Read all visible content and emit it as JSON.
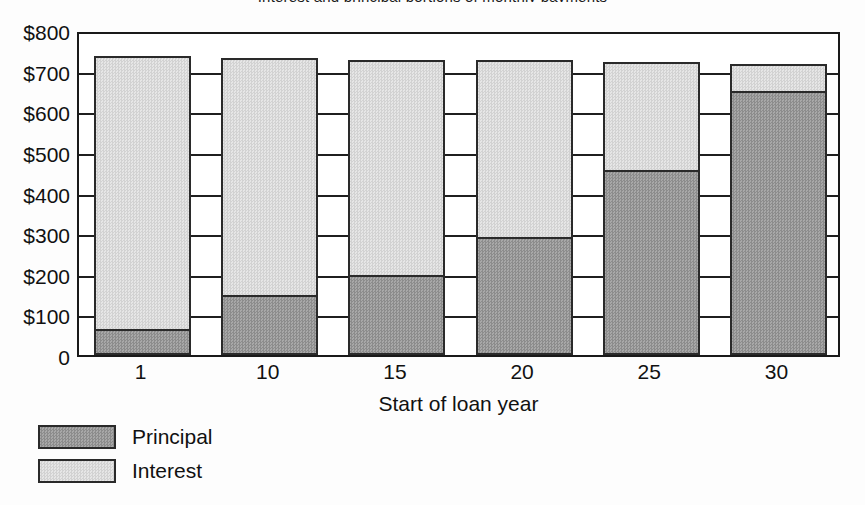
{
  "figure": {
    "title_cropped": "Interest and principal portions of monthly payments",
    "background": "#fdfdfd",
    "frame_color": "#1a1a1a"
  },
  "colors": {
    "principal": "#999999",
    "interest": "#dcdcdc",
    "ink": "#1a1a1a"
  },
  "legend": {
    "position": "bottom-left",
    "items": [
      {
        "label": "Principal",
        "swatch": "principal"
      },
      {
        "label": "Interest",
        "swatch": "interest"
      }
    ]
  },
  "axes": {
    "y": {
      "ticks": [
        "$800",
        "$700",
        "$600",
        "$500",
        "$400",
        "$300",
        "$200",
        "$100",
        "0"
      ],
      "values": [
        800,
        700,
        600,
        500,
        400,
        300,
        200,
        100,
        0
      ],
      "min": 0,
      "max": 800,
      "step": 100
    },
    "x": {
      "label": "Start of loan year",
      "ticks": [
        "1",
        "10",
        "15",
        "20",
        "25",
        "30"
      ]
    }
  },
  "chart_data": {
    "type": "bar",
    "stacked": true,
    "title": "Interest and principal portions of monthly payments",
    "xlabel": "Start of loan year",
    "ylabel": "",
    "categories": [
      "1",
      "10",
      "15",
      "20",
      "25",
      "30"
    ],
    "series": [
      {
        "name": "Principal",
        "color": "#999999",
        "values": [
          63,
          147,
          196,
          291,
          456,
          650
        ]
      },
      {
        "name": "Interest",
        "color": "#dcdcdc",
        "values": [
          672,
          583,
          531,
          434,
          266,
          66
        ]
      }
    ],
    "totals": [
      735,
      730,
      727,
      725,
      722,
      716
    ],
    "ylim": [
      0,
      800
    ],
    "ytick_step": 100,
    "grid": true,
    "legend_position": "bottom-left"
  }
}
